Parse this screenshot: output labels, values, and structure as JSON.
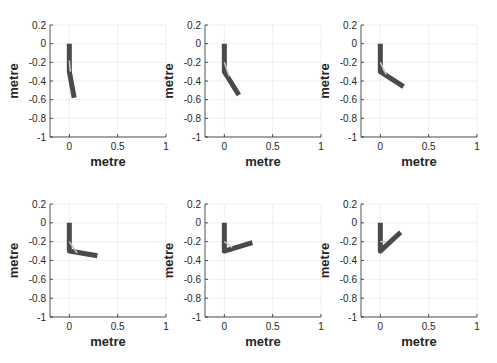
{
  "chart_data": [
    {
      "type": "line",
      "title": "",
      "xlabel": "metre",
      "ylabel": "metre",
      "xlim": [
        -0.2,
        1
      ],
      "ylim": [
        -1,
        0.2
      ],
      "grid": true,
      "xticks": [
        "0",
        "0.5",
        "1"
      ],
      "yticks": [
        "0.2",
        "0",
        "-0.2",
        "-0.4",
        "-0.6",
        "-0.8",
        "-1"
      ],
      "series": [
        {
          "name": "arm",
          "x": [
            0,
            0.0,
            0.05
          ],
          "y": [
            0,
            -0.3,
            -0.58
          ]
        },
        {
          "name": "inner",
          "x": [
            0,
            0.01
          ],
          "y": [
            -0.18,
            -0.3
          ]
        }
      ]
    },
    {
      "type": "line",
      "title": "",
      "xlabel": "metre",
      "ylabel": "metre",
      "xlim": [
        -0.2,
        1
      ],
      "ylim": [
        -1,
        0.2
      ],
      "grid": true,
      "xticks": [
        "0",
        "0.5",
        "1"
      ],
      "yticks": [
        "0.2",
        "0",
        "-0.2",
        "-0.4",
        "-0.6",
        "-0.8",
        "-1"
      ],
      "series": [
        {
          "name": "arm",
          "x": [
            0,
            0,
            0.15
          ],
          "y": [
            0,
            -0.3,
            -0.55
          ]
        },
        {
          "name": "inner",
          "x": [
            0,
            0.05
          ],
          "y": [
            -0.2,
            -0.35
          ]
        }
      ]
    },
    {
      "type": "line",
      "title": "",
      "xlabel": "metre",
      "ylabel": "metre",
      "xlim": [
        -0.2,
        1
      ],
      "ylim": [
        -1,
        0.2
      ],
      "grid": true,
      "xticks": [
        "0",
        "0.5",
        "1"
      ],
      "yticks": [
        "0.2",
        "0",
        "-0.2",
        "-0.4",
        "-0.6",
        "-0.8",
        "-1"
      ],
      "series": [
        {
          "name": "arm",
          "x": [
            0,
            0,
            0.24
          ],
          "y": [
            0,
            -0.3,
            -0.46
          ]
        },
        {
          "name": "inner",
          "x": [
            0,
            0.06
          ],
          "y": [
            -0.2,
            -0.33
          ]
        }
      ]
    },
    {
      "type": "line",
      "title": "",
      "xlabel": "metre",
      "ylabel": "metre",
      "xlim": [
        -0.2,
        1
      ],
      "ylim": [
        -1,
        0.2
      ],
      "grid": true,
      "xticks": [
        "0",
        "0.5",
        "1"
      ],
      "yticks": [
        "0.2",
        "0",
        "-0.2",
        "-0.4",
        "-0.6",
        "-0.8",
        "-1"
      ],
      "series": [
        {
          "name": "arm",
          "x": [
            0,
            0,
            0.29
          ],
          "y": [
            0,
            -0.3,
            -0.35
          ]
        },
        {
          "name": "inner",
          "x": [
            0,
            0.08
          ],
          "y": [
            -0.2,
            -0.32
          ]
        }
      ]
    },
    {
      "type": "line",
      "title": "",
      "xlabel": "metre",
      "ylabel": "metre",
      "xlim": [
        -0.2,
        1
      ],
      "ylim": [
        -1,
        0.2
      ],
      "grid": true,
      "xticks": [
        "0",
        "0.5",
        "1"
      ],
      "yticks": [
        "0.2",
        "0",
        "-0.2",
        "-0.4",
        "-0.6",
        "-0.8",
        "-1"
      ],
      "series": [
        {
          "name": "arm",
          "x": [
            0,
            0,
            0.29
          ],
          "y": [
            0,
            -0.3,
            -0.21
          ]
        },
        {
          "name": "inner",
          "x": [
            0,
            0.08
          ],
          "y": [
            -0.2,
            -0.26
          ]
        }
      ]
    },
    {
      "type": "line",
      "title": "",
      "xlabel": "metre",
      "ylabel": "metre",
      "xlim": [
        -0.2,
        1
      ],
      "ylim": [
        -1,
        0.2
      ],
      "grid": true,
      "xticks": [
        "0",
        "0.5",
        "1"
      ],
      "yticks": [
        "0.2",
        "0",
        "-0.2",
        "-0.4",
        "-0.6",
        "-0.8",
        "-1"
      ],
      "series": [
        {
          "name": "arm",
          "x": [
            0,
            0,
            0.21
          ],
          "y": [
            0,
            -0.3,
            -0.1
          ]
        },
        {
          "name": "inner",
          "x": [
            0,
            0.06
          ],
          "y": [
            -0.2,
            -0.2
          ]
        }
      ]
    }
  ],
  "style": {
    "arm_color": "#4a4a4a",
    "inner_color": "#c8c8c8",
    "axis_color": "#262626",
    "grid_color": "#e6e6e6"
  }
}
